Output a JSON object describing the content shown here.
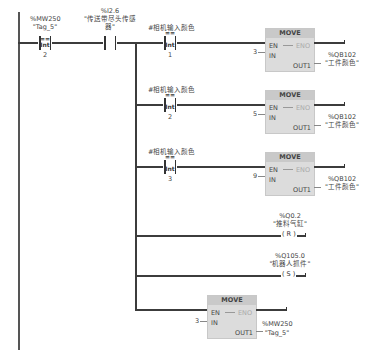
{
  "network": {
    "compare_contact": {
      "address": "%MW250",
      "tag": "\"Tag_5\"",
      "operator": "==",
      "type": "Int",
      "value": "2"
    },
    "sensor_contact": {
      "address": "%I2.6",
      "tag_line1": "\"传送带尽头传感",
      "tag_line2": "器\""
    },
    "branches": [
      {
        "compare": {
          "operand": "#相机输入颜色",
          "operator": "==",
          "type": "Int",
          "value": "1"
        },
        "move": {
          "title": "MOVE",
          "en": "EN",
          "eno": "ENO",
          "in_label": "IN",
          "out_label": "OUT1",
          "in_value": "3",
          "out_address": "%QB102",
          "out_tag": "\"工件颜色\""
        }
      },
      {
        "compare": {
          "operand": "#相机输入颜色",
          "operator": "==",
          "type": "Int",
          "value": "2"
        },
        "move": {
          "title": "MOVE",
          "en": "EN",
          "eno": "ENO",
          "in_label": "IN",
          "out_label": "OUT1",
          "in_value": "5",
          "out_address": "%QB102",
          "out_tag": "\"工件颜色\""
        }
      },
      {
        "compare": {
          "operand": "#相机输入颜色",
          "operator": "==",
          "type": "Int",
          "value": "3"
        },
        "move": {
          "title": "MOVE",
          "en": "EN",
          "eno": "ENO",
          "in_label": "IN",
          "out_label": "OUT1",
          "in_value": "9",
          "out_address": "%QB102",
          "out_tag": "\"工件颜色\""
        }
      }
    ],
    "coils": [
      {
        "address": "%Q0.2",
        "tag": "\"推料气缸\"",
        "symbol": "( R )"
      },
      {
        "address": "%Q105.0",
        "tag": "\"机器人抓件\"",
        "symbol": "( S )"
      }
    ],
    "final_move": {
      "title": "MOVE",
      "en": "EN",
      "eno": "ENO",
      "in_label": "IN",
      "out_label": "OUT1",
      "in_value": "3",
      "out_address": "%MW250",
      "out_tag": "\"Tag_5\""
    }
  }
}
